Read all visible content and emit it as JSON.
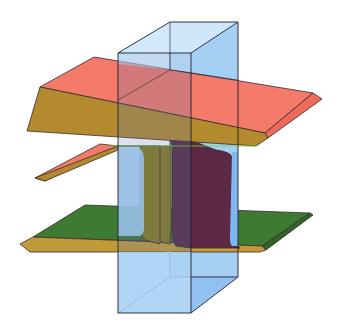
{
  "figure": {
    "title": "",
    "components": [
      {
        "name": "upper-flange",
        "face_top_color": "#f47a6a",
        "face_front_color": "#b48a2e"
      },
      {
        "name": "web",
        "left_color": "#8a7c1c",
        "right_color": "#5c2a45"
      },
      {
        "name": "lower-flange",
        "face_top_color": "#3f7a33",
        "face_front_color": "#c39a3a"
      },
      {
        "name": "upper-left-wing",
        "face_top_color": "#f47a6a",
        "face_front_color": "#b48a2e"
      },
      {
        "name": "cutting-box",
        "fill_color": "#a9d2f5",
        "side_color": "#7fb6ee",
        "edge_color": "#1c2030",
        "opacity": 0.75
      }
    ],
    "accent_line_color": "#7ad13a"
  }
}
